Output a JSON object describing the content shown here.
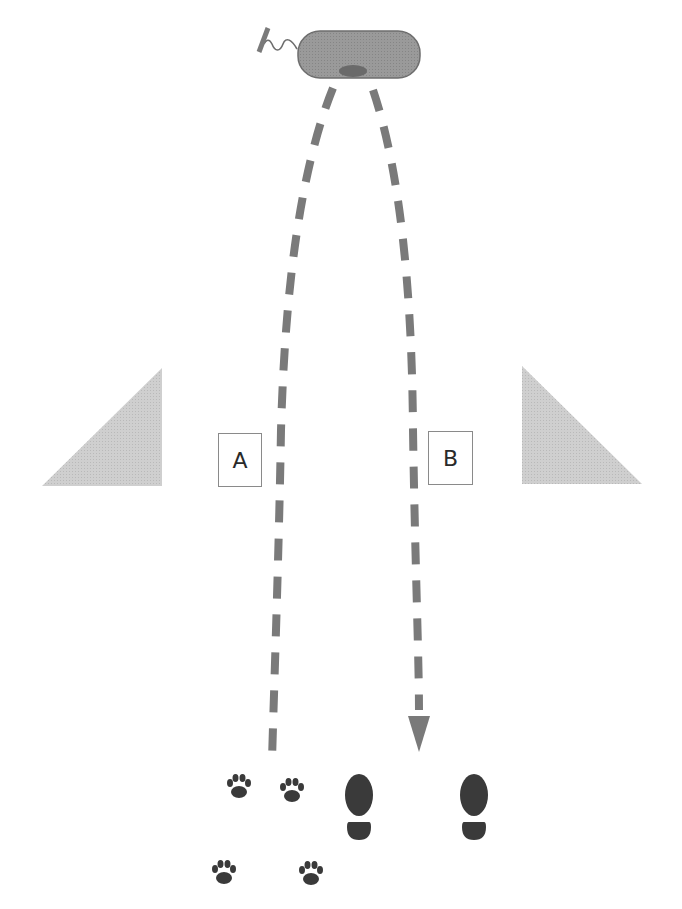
{
  "diagram": {
    "labels": {
      "path_a": "A",
      "path_b": "B"
    },
    "elements": {
      "source": {
        "icon": "bacterium-icon",
        "description": "flagellated rod-shaped bacterium at top"
      },
      "left_obstacle": {
        "icon": "right-triangle-left-icon"
      },
      "right_obstacle": {
        "icon": "right-triangle-right-icon"
      },
      "path_a": {
        "style": "dashed",
        "arrowhead": false,
        "ends_at": "paw-prints"
      },
      "path_b": {
        "style": "dashed",
        "arrowhead": true,
        "ends_at": "shoe-prints"
      },
      "animal_tracks": {
        "icon": "paw-print-icon",
        "count": 4
      },
      "human_tracks": {
        "icon": "shoe-print-icon",
        "count": 2
      }
    },
    "colors": {
      "dash": "#7a7a7a",
      "bacterium_fill": "#9a9a9a",
      "bacterium_nucleoid": "#6e6e6e",
      "triangle_fill": "#cfcfcf",
      "prints": "#3a3a3a",
      "box_border": "#8a8a8a"
    }
  }
}
